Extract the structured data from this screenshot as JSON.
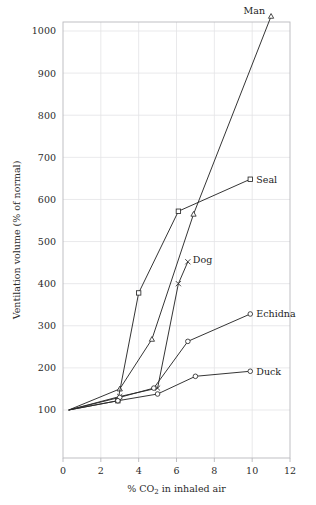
{
  "chart_data": {
    "type": "line",
    "title": "",
    "xlabel": "% CO2 in inhaled air",
    "xlabel_parts": {
      "prefix": "% CO",
      "sub": "2",
      "suffix": " in inhaled air"
    },
    "ylabel": "Ventilation volume (% of normal)",
    "xlim": [
      0,
      12
    ],
    "ylim": [
      0,
      1060
    ],
    "xticks": [
      0,
      2,
      4,
      6,
      8,
      10,
      12
    ],
    "xtick_labels": [
      "0",
      "2",
      "4",
      "6",
      "8",
      "10",
      "12"
    ],
    "yticks": [
      100,
      200,
      300,
      400,
      500,
      600,
      700,
      800,
      900,
      1000
    ],
    "ytick_labels": [
      "100",
      "200",
      "300",
      "400",
      "500",
      "600",
      "700",
      "800",
      "900",
      "1000"
    ],
    "grid": true,
    "legend_position": "inline-end-of-line",
    "series": [
      {
        "name": "Man",
        "label": "Man",
        "marker": "triangle",
        "points": [
          [
            0.3,
            100
          ],
          [
            3.0,
            150
          ],
          [
            4.7,
            268
          ],
          [
            6.9,
            565
          ],
          [
            11.0,
            1035
          ]
        ]
      },
      {
        "name": "Seal",
        "label": "Seal",
        "marker": "square",
        "points": [
          [
            0.3,
            100
          ],
          [
            2.9,
            122
          ],
          [
            4.0,
            378
          ],
          [
            6.1,
            572
          ],
          [
            9.9,
            648
          ]
        ]
      },
      {
        "name": "Dog",
        "label": "Dog",
        "marker": "x",
        "points": [
          [
            0.3,
            100
          ],
          [
            3.0,
            132
          ],
          [
            5.0,
            152
          ],
          [
            6.1,
            400
          ],
          [
            6.6,
            452
          ]
        ]
      },
      {
        "name": "Echidna",
        "label": "Echidna",
        "marker": "circle",
        "points": [
          [
            0.3,
            100
          ],
          [
            3.0,
            130
          ],
          [
            4.8,
            152
          ],
          [
            6.6,
            263
          ],
          [
            9.9,
            328
          ]
        ]
      },
      {
        "name": "Duck",
        "label": "Duck",
        "marker": "circle",
        "points": [
          [
            0.3,
            100
          ],
          [
            2.9,
            122
          ],
          [
            5.0,
            138
          ],
          [
            7.0,
            180
          ],
          [
            9.9,
            192
          ]
        ]
      }
    ]
  },
  "colors": {
    "line": "#2a2a2a",
    "grid": "#e3e3e6",
    "frame": "#b9b9bd",
    "text": "#2b2b2b",
    "background": "#ffffff"
  }
}
